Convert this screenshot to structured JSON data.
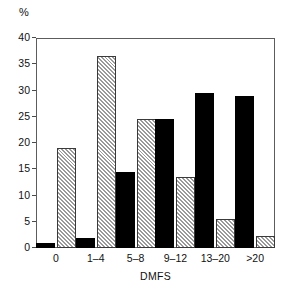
{
  "chart_data": {
    "type": "bar",
    "title": "",
    "subtitle": "",
    "xlabel": "DMFS",
    "ylabel": "%",
    "categories": [
      "0",
      "1–4",
      "5–8",
      "9–12",
      "13–20",
      ">20"
    ],
    "series": [
      {
        "name": "solid-black-series",
        "fill": "solid-black",
        "color": "#000000",
        "values": [
          1,
          2,
          14.5,
          24.5,
          29.5,
          29
        ]
      },
      {
        "name": "hatched-series",
        "fill": "diagonal-hatch",
        "color": "#9a9a9a",
        "values": [
          19,
          36.5,
          24.5,
          13.5,
          5.5,
          2.3
        ]
      }
    ],
    "ylim": [
      0,
      40
    ],
    "yticks": [
      0,
      5,
      10,
      15,
      20,
      25,
      30,
      35,
      40
    ],
    "ytick_labels": [
      "0",
      "5",
      "10",
      "15",
      "20",
      "25",
      "30",
      "35",
      "40"
    ],
    "grid": false,
    "legend": false,
    "legend_position": "none",
    "axis_frame": "box",
    "annotations": []
  },
  "colors": {
    "axis": "#5c5c5c",
    "text": "#111111",
    "series_solid": "#000000",
    "series_hatch": "#9a9a9a",
    "background": "#ffffff"
  }
}
